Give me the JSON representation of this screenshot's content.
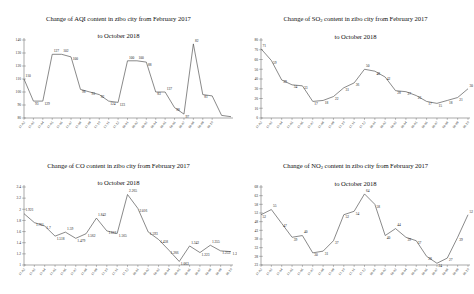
{
  "figure": {
    "charts": [
      {
        "id": "aqi",
        "title_line1": "Change of AQI content in zibo city from February 2017",
        "title_line2": "to October 2018",
        "pollutant": "AQI",
        "subscript": ""
      },
      {
        "id": "so2",
        "title_line1": "Change of SO2 content in zibo city from February 2017",
        "title_line2": "to October 2018",
        "pollutant": "SO",
        "subscript": "2"
      },
      {
        "id": "co",
        "title_line1": "Change of CO content in zibo city from February 2017",
        "title_line2": "to October 2018",
        "pollutant": "CO",
        "subscript": ""
      },
      {
        "id": "no2",
        "title_line1": "Change of NO2 content in zibo city from February 2017",
        "title_line2": "to October 2018",
        "pollutant": "NO",
        "subscript": "2"
      }
    ]
  },
  "chart_data": [
    {
      "type": "line",
      "id": "aqi",
      "title": "Change of AQI content in zibo city from February 2017 to October 2018",
      "xlabel": "",
      "ylabel": "",
      "grid": false,
      "legend": "none",
      "x": [
        "17-02",
        "17-03",
        "17-04",
        "17-05",
        "17-06",
        "17-07",
        "17-08",
        "17-09",
        "17-10",
        "17-11",
        "17-12",
        "18-01",
        "18-02",
        "18-03",
        "18-04",
        "18-05",
        "18-06",
        "18-07",
        "18-08",
        "18-09",
        "18-10"
      ],
      "categories": [
        "17-02",
        "17-03",
        "17-04",
        "17-05",
        "17-06",
        "17-07",
        "17-08",
        "17-09",
        "17-10",
        "17-11",
        "17-12",
        "18-01",
        "18-02",
        "18-03",
        "18-04",
        "18-05",
        "18-06",
        "18-07",
        "18-08",
        "18-09",
        "18-10"
      ],
      "values": [
        110,
        93,
        93,
        129,
        129,
        127,
        102,
        100,
        98,
        93,
        92,
        124,
        124,
        123,
        100,
        100,
        88,
        83,
        137,
        98,
        97,
        82,
        81
      ],
      "ylim": [
        80,
        140
      ],
      "yticks": [
        80,
        90,
        100,
        110,
        120,
        130,
        140
      ],
      "data_labels": [
        110,
        93,
        129,
        127,
        102,
        100,
        98,
        93,
        92,
        124,
        123,
        100,
        100,
        88,
        83,
        137,
        98,
        97,
        82,
        81
      ]
    },
    {
      "type": "line",
      "id": "so2",
      "title": "Change of SO2 content in zibo city from February 2017 to October 2018",
      "xlabel": "",
      "ylabel": "",
      "grid": false,
      "legend": "none",
      "x": [
        "17-02",
        "17-03",
        "17-04",
        "17-05",
        "17-06",
        "17-07",
        "17-08",
        "17-09",
        "17-10",
        "17-11",
        "17-12",
        "18-01",
        "18-02",
        "18-03",
        "18-04",
        "18-05",
        "18-06",
        "18-07",
        "18-08",
        "18-09",
        "18-10"
      ],
      "categories": [
        "17-02",
        "17-03",
        "17-04",
        "17-05",
        "17-06",
        "17-07",
        "17-08",
        "17-09",
        "17-10",
        "17-11",
        "17-12",
        "18-01",
        "18-02",
        "18-03",
        "18-04",
        "18-05",
        "18-06",
        "18-07",
        "18-08",
        "18-09",
        "18-10"
      ],
      "values": [
        71,
        59,
        39,
        34,
        33,
        17,
        18,
        22,
        31,
        36,
        50,
        48,
        42,
        28,
        27,
        23,
        17,
        15,
        18,
        21,
        30
      ],
      "ylim": [
        0,
        80
      ],
      "yticks": [
        0,
        10,
        20,
        30,
        40,
        50,
        60,
        70,
        80
      ],
      "data_labels": [
        71,
        59,
        39,
        34,
        33,
        17,
        18,
        22,
        31,
        36,
        50,
        48,
        42,
        28,
        27,
        23,
        17,
        15,
        18,
        21,
        30
      ]
    },
    {
      "type": "line",
      "id": "co",
      "title": "Change of CO content in zibo city from February 2017 to October 2018",
      "xlabel": "",
      "ylabel": "",
      "grid": false,
      "legend": "none",
      "x": [
        "17-02",
        "17-03",
        "17-04",
        "17-05",
        "17-06",
        "17-07",
        "17-08",
        "17-09",
        "17-10",
        "17-11",
        "17-12",
        "18-01",
        "18-02",
        "18-03",
        "18-04",
        "18-05",
        "18-06",
        "18-07",
        "18-08",
        "18-09",
        "18-10"
      ],
      "categories": [
        "17-02",
        "17-03",
        "17-04",
        "17-05",
        "17-06",
        "17-07",
        "17-08",
        "17-09",
        "17-10",
        "17-11",
        "17-12",
        "18-01",
        "18-02",
        "18-03",
        "18-04",
        "18-05",
        "18-06",
        "18-07",
        "18-08",
        "18-09",
        "18-10"
      ],
      "values": [
        1.921,
        1.761,
        1.7,
        1.518,
        1.59,
        1.479,
        1.562,
        1.842,
        1.612,
        1.565,
        2.265,
        2.016,
        1.593,
        1.458,
        1.266,
        1.063,
        1.342,
        1.223,
        1.355,
        1.253,
        1.24
      ],
      "ylim": [
        1,
        2.4
      ],
      "yticks": [
        1,
        1.2,
        1.4,
        1.6,
        1.8,
        2,
        2.2,
        2.4
      ],
      "data_labels": [
        "1.921",
        "1.761",
        "1.7",
        "1.518",
        "1.59",
        "1.479",
        "1.562",
        "1.842",
        "1.612",
        "1.565",
        "2.265",
        "2.016",
        "1.593",
        "1.458",
        "1.266",
        "1.063",
        "1.342",
        "1.223",
        "1.355",
        "1.253",
        "1.24"
      ]
    },
    {
      "type": "line",
      "id": "no2",
      "title": "Change of NO2 content in zibo city from February 2017 to October 2018",
      "xlabel": "",
      "ylabel": "",
      "grid": false,
      "legend": "none",
      "x": [
        "17-02",
        "17-03",
        "17-04",
        "17-05",
        "17-06",
        "17-07",
        "17-08",
        "17-09",
        "17-10",
        "17-11",
        "17-12",
        "18-01",
        "18-02",
        "18-03",
        "18-04",
        "18-05",
        "18-06",
        "18-07",
        "18-08",
        "18-09",
        "18-10"
      ],
      "categories": [
        "17-02",
        "17-03",
        "17-04",
        "17-05",
        "17-06",
        "17-07",
        "17-08",
        "17-09",
        "17-10",
        "17-11",
        "17-12",
        "18-01",
        "18-02",
        "18-03",
        "18-04",
        "18-05",
        "18-06",
        "18-07",
        "18-08",
        "18-09",
        "18-10"
      ],
      "values": [
        52,
        55,
        47,
        39,
        40,
        30,
        31,
        37,
        52,
        54,
        64,
        58,
        40,
        44,
        39,
        37,
        28,
        24,
        27,
        39,
        52
      ],
      "ylim": [
        23,
        68
      ],
      "yticks": [
        23,
        28,
        33,
        38,
        43,
        48,
        53,
        58,
        63,
        68
      ],
      "data_labels": [
        52,
        55,
        47,
        39,
        40,
        30,
        31,
        37,
        52,
        54,
        64,
        58,
        40,
        44,
        39,
        37,
        28,
        24,
        27,
        39,
        52
      ]
    }
  ]
}
